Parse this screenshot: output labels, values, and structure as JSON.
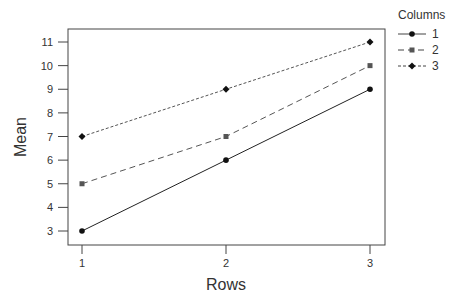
{
  "chart_data": {
    "type": "line",
    "title": "",
    "xlabel": "Rows",
    "ylabel": "Mean",
    "x": [
      1,
      2,
      3
    ],
    "x_ticks": [
      "1",
      "2",
      "3"
    ],
    "y_ticks": [
      "3",
      "4",
      "5",
      "6",
      "7",
      "8",
      "9",
      "10",
      "11"
    ],
    "ylim": [
      3,
      11
    ],
    "xlim": [
      1,
      3
    ],
    "grid": false,
    "legend": {
      "title": "Columns",
      "placement": "right-top"
    },
    "series": [
      {
        "name": "1",
        "values": [
          3,
          6,
          9
        ],
        "marker": "circle",
        "dash": "solid"
      },
      {
        "name": "2",
        "values": [
          5,
          7,
          10
        ],
        "marker": "square",
        "dash": "long-dash"
      },
      {
        "name": "3",
        "values": [
          7,
          9,
          11
        ],
        "marker": "diamond",
        "dash": "short-dash"
      }
    ]
  }
}
